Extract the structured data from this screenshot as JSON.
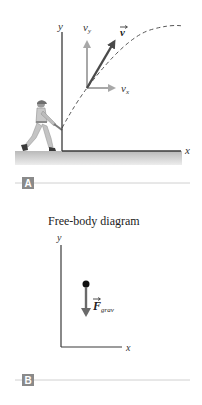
{
  "panel_a": {
    "badge": "A",
    "axis_y_label": "y",
    "axis_x_label": "x",
    "vy_label": "v",
    "vy_sub": "y",
    "vx_label": "v",
    "vx_sub": "x",
    "v_label": "v",
    "trajectory_style": "dashed",
    "figure": "baseball batter swinging bat at origin"
  },
  "panel_b": {
    "badge": "B",
    "title": "Free-body diagram",
    "axis_y_label": "y",
    "axis_x_label": "x",
    "force_label": "F",
    "force_sub": "grav"
  },
  "colors": {
    "axis": "#3a3a3a",
    "component_arrow": "#a8a8a8",
    "velocity_arrow": "#555555",
    "ground": "#cfcfcf",
    "badge_bg": "#8a8a8a",
    "divider": "#d0d0d0",
    "force_arrow": "#6a6a6a"
  }
}
